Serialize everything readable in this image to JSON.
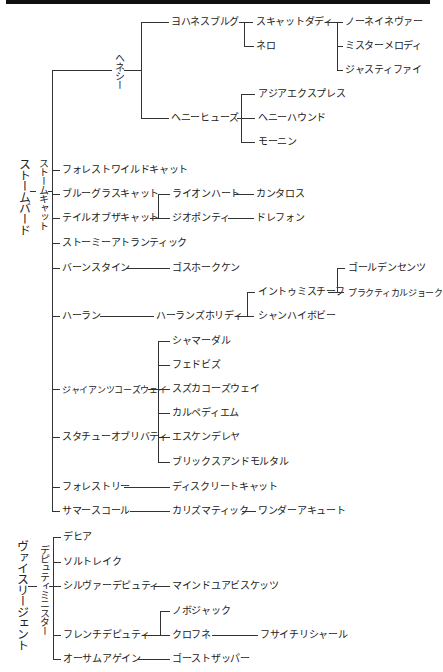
{
  "header": {
    "bar": ""
  },
  "roots": [
    {
      "label": "ストームバード",
      "child": {
        "label": "ストームキャット",
        "children": [
          {
            "label": "ヘネシー",
            "children": [
              {
                "label": "ヨハネスブルグ",
                "children": [
                  {
                    "label": "スキャットダディ",
                    "children": [
                      {
                        "label": "ノーネイネヴァー"
                      },
                      {
                        "label": "ミスターメロディ"
                      },
                      {
                        "label": "ジャスティファイ"
                      }
                    ]
                  },
                  {
                    "label": "ネロ"
                  }
                ]
              },
              {
                "label": "ヘニーヒューズ",
                "children": [
                  {
                    "label": "アジアエクスプレス"
                  },
                  {
                    "label": "ヘニーハウンド"
                  },
                  {
                    "label": "モーニン"
                  }
                ]
              }
            ]
          },
          {
            "label": "フォレストワイルドキャット"
          },
          {
            "label": "ブルーグラスキャット",
            "children": [
              {
                "label": "ライオンハート",
                "children": [
                  {
                    "label": "カンタロス"
                  }
                ]
              }
            ]
          },
          {
            "label": "テイルオブザキャット",
            "children": [
              {
                "label": "ジオポンティ",
                "children": [
                  {
                    "label": "ドレフォン"
                  }
                ]
              }
            ]
          },
          {
            "label": "ストーミーアトランティック"
          },
          {
            "label": "バーンスタイン",
            "children": [
              {
                "label": "ゴスホークケン"
              }
            ]
          },
          {
            "label": "ハーラン",
            "children": [
              {
                "label": "ハーランズホリディ",
                "children": [
                  {
                    "label": "イントゥミスチーフ",
                    "children": [
                      {
                        "label": "ゴールデンセンツ"
                      },
                      {
                        "label": "プラクティカルジョーク"
                      }
                    ]
                  },
                  {
                    "label": "シャンハイボビー"
                  }
                ]
              }
            ]
          },
          {
            "label": "ジャイアンツコーズウェイ",
            "children": [
              {
                "label": "シャマーダル"
              },
              {
                "label": "フェドビズ"
              },
              {
                "label": "スズカコーズウェイ"
              },
              {
                "label": "カルペディエム"
              },
              {
                "label": "エスケンデレヤ"
              },
              {
                "label": "ブリックスアンドモルタル"
              }
            ]
          },
          {
            "label": "スタチューオブリバティ"
          },
          {
            "label": "フォレストリー",
            "children": [
              {
                "label": "ディスクリートキャット"
              }
            ]
          },
          {
            "label": "サマースコール",
            "children": [
              {
                "label": "カリズマティック",
                "children": [
                  {
                    "label": "ワンダーアキュート"
                  }
                ]
              }
            ]
          }
        ]
      }
    },
    {
      "label": "ヴァイスリージェント",
      "child": {
        "label": "デピュティミニスター",
        "children": [
          {
            "label": "デヒア"
          },
          {
            "label": "ソルトレイク"
          },
          {
            "label": "シルヴァーデピュティ",
            "children": [
              {
                "label": "マインドユアビスケッツ"
              }
            ]
          },
          {
            "label": "フレンチデピュティ",
            "children": [
              {
                "label": "ノボジャック"
              },
              {
                "label": "クロフネ",
                "children": [
                  {
                    "label": "フサイチリシャール"
                  }
                ]
              }
            ]
          },
          {
            "label": "オーサムアゲイン",
            "children": [
              {
                "label": "ゴーストザッパー"
              }
            ]
          }
        ]
      }
    }
  ]
}
